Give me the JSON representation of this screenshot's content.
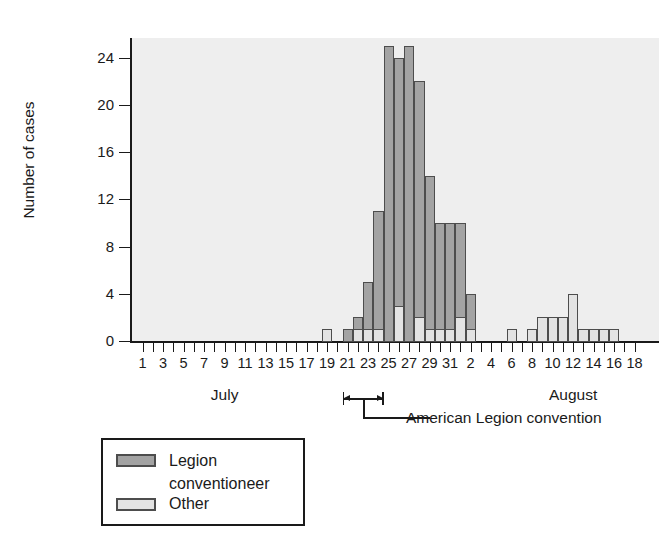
{
  "chart_data": {
    "type": "bar",
    "subtype": "stacked-histogram-epidemic-curve",
    "title": "",
    "xlabel": "",
    "ylabel": "Number of cases",
    "ylim": [
      0,
      26
    ],
    "ytick_values": [
      0,
      4,
      8,
      12,
      16,
      20,
      24
    ],
    "ytick_labels": [
      "0",
      "4",
      "8",
      "12",
      "16",
      "20",
      "24"
    ],
    "grid": false,
    "legend_position": "below-left",
    "x_axis": {
      "months": [
        {
          "name": "July",
          "label_day": 9,
          "days": [
            1,
            2,
            3,
            4,
            5,
            6,
            7,
            8,
            9,
            10,
            11,
            12,
            13,
            14,
            15,
            16,
            17,
            18,
            19,
            20,
            21,
            22,
            23,
            24,
            25,
            26,
            27,
            28,
            29,
            30,
            31
          ]
        },
        {
          "name": "August",
          "label_day": 12,
          "days": [
            1,
            2,
            3,
            4,
            5,
            6,
            7,
            8,
            9,
            10,
            11,
            12,
            13,
            14,
            15,
            16,
            17,
            18
          ]
        }
      ],
      "tick_labels": [
        "1",
        "3",
        "5",
        "7",
        "9",
        "11",
        "13",
        "15",
        "17",
        "19",
        "21",
        "23",
        "25",
        "27",
        "29",
        "31",
        "2",
        "4",
        "6",
        "8",
        "10",
        "12",
        "14",
        "16",
        "18"
      ],
      "tick_step_days": 2
    },
    "series": [
      {
        "name": "Legion conventioneer",
        "color": "#a3a3a3"
      },
      {
        "name": "Other",
        "color": "#e3e3e3"
      }
    ],
    "bars": [
      {
        "month": "July",
        "day": 1,
        "legion": 0,
        "other": 0
      },
      {
        "month": "July",
        "day": 2,
        "legion": 0,
        "other": 0
      },
      {
        "month": "July",
        "day": 3,
        "legion": 0,
        "other": 0
      },
      {
        "month": "July",
        "day": 4,
        "legion": 0,
        "other": 0
      },
      {
        "month": "July",
        "day": 5,
        "legion": 0,
        "other": 0
      },
      {
        "month": "July",
        "day": 6,
        "legion": 0,
        "other": 0
      },
      {
        "month": "July",
        "day": 7,
        "legion": 0,
        "other": 0
      },
      {
        "month": "July",
        "day": 8,
        "legion": 0,
        "other": 0
      },
      {
        "month": "July",
        "day": 9,
        "legion": 0,
        "other": 0
      },
      {
        "month": "July",
        "day": 10,
        "legion": 0,
        "other": 0
      },
      {
        "month": "July",
        "day": 11,
        "legion": 0,
        "other": 0
      },
      {
        "month": "July",
        "day": 12,
        "legion": 0,
        "other": 0
      },
      {
        "month": "July",
        "day": 13,
        "legion": 0,
        "other": 0
      },
      {
        "month": "July",
        "day": 14,
        "legion": 0,
        "other": 0
      },
      {
        "month": "July",
        "day": 15,
        "legion": 0,
        "other": 0
      },
      {
        "month": "July",
        "day": 16,
        "legion": 0,
        "other": 0
      },
      {
        "month": "July",
        "day": 17,
        "legion": 0,
        "other": 0
      },
      {
        "month": "July",
        "day": 18,
        "legion": 0,
        "other": 0
      },
      {
        "month": "July",
        "day": 19,
        "legion": 0,
        "other": 1
      },
      {
        "month": "July",
        "day": 20,
        "legion": 0,
        "other": 0
      },
      {
        "month": "July",
        "day": 21,
        "legion": 1,
        "other": 0
      },
      {
        "month": "July",
        "day": 22,
        "legion": 1,
        "other": 1
      },
      {
        "month": "July",
        "day": 23,
        "legion": 4,
        "other": 1
      },
      {
        "month": "July",
        "day": 24,
        "legion": 10,
        "other": 1
      },
      {
        "month": "July",
        "day": 25,
        "legion": 25,
        "other": 0
      },
      {
        "month": "July",
        "day": 26,
        "legion": 21,
        "other": 3
      },
      {
        "month": "July",
        "day": 27,
        "legion": 25,
        "other": 0
      },
      {
        "month": "July",
        "day": 28,
        "legion": 20,
        "other": 2
      },
      {
        "month": "July",
        "day": 29,
        "legion": 13,
        "other": 1
      },
      {
        "month": "July",
        "day": 30,
        "legion": 9,
        "other": 1
      },
      {
        "month": "July",
        "day": 31,
        "legion": 9,
        "other": 1
      },
      {
        "month": "August",
        "day": 1,
        "legion": 8,
        "other": 2
      },
      {
        "month": "August",
        "day": 2,
        "legion": 3,
        "other": 1
      },
      {
        "month": "August",
        "day": 3,
        "legion": 0,
        "other": 0
      },
      {
        "month": "August",
        "day": 4,
        "legion": 0,
        "other": 0
      },
      {
        "month": "August",
        "day": 5,
        "legion": 0,
        "other": 0
      },
      {
        "month": "August",
        "day": 6,
        "legion": 0,
        "other": 1
      },
      {
        "month": "August",
        "day": 7,
        "legion": 0,
        "other": 0
      },
      {
        "month": "August",
        "day": 8,
        "legion": 0,
        "other": 1
      },
      {
        "month": "August",
        "day": 9,
        "legion": 0,
        "other": 2
      },
      {
        "month": "August",
        "day": 10,
        "legion": 0,
        "other": 2
      },
      {
        "month": "August",
        "day": 11,
        "legion": 0,
        "other": 2
      },
      {
        "month": "August",
        "day": 12,
        "legion": 0,
        "other": 4
      },
      {
        "month": "August",
        "day": 13,
        "legion": 0,
        "other": 1
      },
      {
        "month": "August",
        "day": 14,
        "legion": 0,
        "other": 1
      },
      {
        "month": "August",
        "day": 15,
        "legion": 0,
        "other": 1
      },
      {
        "month": "August",
        "day": 16,
        "legion": 0,
        "other": 1
      },
      {
        "month": "August",
        "day": 17,
        "legion": 0,
        "other": 0
      },
      {
        "month": "August",
        "day": 18,
        "legion": 0,
        "other": 0
      }
    ],
    "annotation": {
      "label": "American Legion convention",
      "span_start": {
        "month": "July",
        "day": 21
      },
      "span_end": {
        "month": "July",
        "day": 24
      }
    }
  },
  "legend": {
    "items": [
      {
        "label_line1": "Legion",
        "label_line2": "conventioneer",
        "color": "#a3a3a3"
      },
      {
        "label_line1": "Other",
        "label_line2": "",
        "color": "#e3e3e3"
      }
    ]
  },
  "colors": {
    "legion": "#a3a3a3",
    "other": "#e3e3e3",
    "bar_border": "#4d4d4d",
    "plot_background": "#eeeeee",
    "axis": "#1a1a1a",
    "page_background": "#ffffff"
  }
}
